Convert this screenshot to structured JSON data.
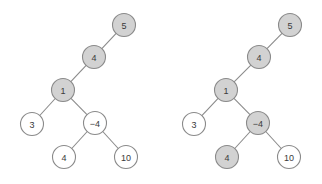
{
  "figure": {
    "title": "",
    "background_color": "#ffffff",
    "width": 322,
    "height": 184,
    "node_radius": 11.5,
    "colors": {
      "highlight_fill": "#d2d2d2",
      "plain_fill": "#ffffff",
      "stroke": "#8a8a8a",
      "label": "#3a3a3a"
    }
  },
  "chart_data": {
    "type": "diagram",
    "diagram_kind": "binary-tree",
    "panels": [
      {
        "name": "left-tree",
        "caption": "",
        "nodes": [
          {
            "id": "L5",
            "label": "5",
            "x": 124,
            "y": 25,
            "state": "highlighted"
          },
          {
            "id": "L4a",
            "label": "4",
            "x": 94,
            "y": 57,
            "state": "highlighted"
          },
          {
            "id": "L1",
            "label": "1",
            "x": 63,
            "y": 90,
            "state": "highlighted"
          },
          {
            "id": "L3",
            "label": "3",
            "x": 32,
            "y": 124,
            "state": "plain"
          },
          {
            "id": "Lm4",
            "label": "−4",
            "x": 95,
            "y": 123,
            "state": "plain"
          },
          {
            "id": "L4b",
            "label": "4",
            "x": 64,
            "y": 157,
            "state": "plain"
          },
          {
            "id": "L10",
            "label": "10",
            "x": 126,
            "y": 157,
            "state": "plain"
          }
        ],
        "edges": [
          {
            "from": "L5",
            "to": "L4a"
          },
          {
            "from": "L4a",
            "to": "L1"
          },
          {
            "from": "L1",
            "to": "L3"
          },
          {
            "from": "L1",
            "to": "Lm4"
          },
          {
            "from": "Lm4",
            "to": "L4b"
          },
          {
            "from": "Lm4",
            "to": "L10"
          }
        ]
      },
      {
        "name": "right-tree",
        "caption": "",
        "nodes": [
          {
            "id": "R5",
            "label": "5",
            "x": 290,
            "y": 25,
            "state": "highlighted"
          },
          {
            "id": "R4a",
            "label": "4",
            "x": 259,
            "y": 57,
            "state": "highlighted"
          },
          {
            "id": "R1",
            "label": "1",
            "x": 226,
            "y": 90,
            "state": "highlighted"
          },
          {
            "id": "R3",
            "label": "3",
            "x": 194,
            "y": 124,
            "state": "plain"
          },
          {
            "id": "Rm4",
            "label": "−4",
            "x": 258,
            "y": 123,
            "state": "highlighted"
          },
          {
            "id": "R4b",
            "label": "4",
            "x": 227,
            "y": 157,
            "state": "highlighted"
          },
          {
            "id": "R10",
            "label": "10",
            "x": 289,
            "y": 157,
            "state": "plain"
          }
        ],
        "edges": [
          {
            "from": "R5",
            "to": "R4a"
          },
          {
            "from": "R4a",
            "to": "R1"
          },
          {
            "from": "R1",
            "to": "R3"
          },
          {
            "from": "R1",
            "to": "Rm4"
          },
          {
            "from": "Rm4",
            "to": "R4b"
          },
          {
            "from": "Rm4",
            "to": "R10"
          }
        ]
      }
    ]
  }
}
